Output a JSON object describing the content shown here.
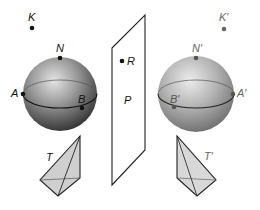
{
  "figure": {
    "colors": {
      "original_sphere_dark": "#3a3a3a",
      "original_sphere_light": "#d8d8d8",
      "image_sphere_dark": "#7a7a7a",
      "image_sphere_light": "#e6e6e6",
      "original_ink": "#111111",
      "image_ink": "#6a6a6a",
      "pyramid_fill": "#d0d0d0",
      "outline": "#222222"
    },
    "labels": {
      "K": "K",
      "K_prime": "K′",
      "N": "N",
      "N_prime": "N′",
      "A": "A",
      "A_prime": "A′",
      "B": "B",
      "B_prime": "B′",
      "R": "R",
      "P": "P",
      "T": "T",
      "T_prime": "T′"
    }
  }
}
